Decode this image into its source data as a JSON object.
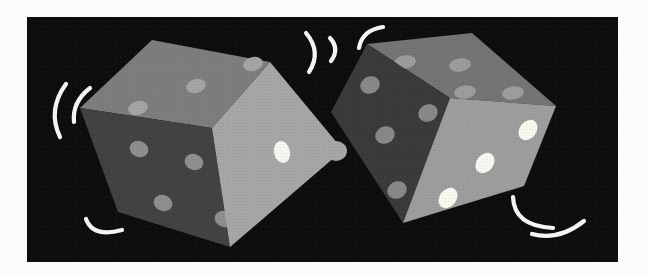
{
  "illustration": {
    "title": "Clip art of two rolling dice on a black panel with white motion lines",
    "background_color": "#fbfbf9",
    "panel_color": "#0d0d0d",
    "motion_line_color": "#f6f6f3",
    "motion_line_width": 4.2,
    "dice": [
      {
        "id": "left-die",
        "knob": {
          "cx": 336,
          "cy": 151,
          "rx": 11,
          "ry": 10
        },
        "faces": [
          {
            "id": "left-die-top-face",
            "value": 3,
            "color": "#7d7d7d",
            "pip_color": "#a4a4a4",
            "points": "152,40 270,62 212,128 80,108",
            "pip_rx": 10,
            "pip_ry": 7,
            "pip_rot": -14,
            "pips": [
              [
                138,
                108
              ],
              [
                196,
                86
              ],
              [
                253,
                64
              ]
            ]
          },
          {
            "id": "left-die-front-face",
            "value": 4,
            "color": "#424242",
            "pip_color": "#8e8e8e",
            "points": "80,108 212,128 230,247 118,212",
            "pip_rx": 9.5,
            "pip_ry": 8,
            "pip_rot": 18,
            "pips": [
              [
                139,
                149
              ],
              [
                194,
                162
              ],
              [
                163,
                203
              ],
              [
                224,
                219
              ]
            ]
          },
          {
            "id": "left-die-right-face",
            "value": 1,
            "color": "#a6a6a6",
            "pip_color": "#f6f6ee",
            "points": "212,128 270,62 343,150 230,247",
            "pip_rx": 8,
            "pip_ry": 11,
            "pip_rot": -12,
            "pips": [
              [
                282,
                152
              ]
            ]
          }
        ]
      },
      {
        "id": "right-die",
        "faces": [
          {
            "id": "right-die-top-face",
            "value": 4,
            "color": "#747474",
            "pip_color": "#9c9c9c",
            "points": "367,44 472,33 556,106 450,98",
            "pip_rx": 11,
            "pip_ry": 6.5,
            "pip_rot": -8,
            "pips": [
              [
                405,
                62
              ],
              [
                460,
                65
              ],
              [
                465,
                92
              ],
              [
                513,
                93
              ]
            ]
          },
          {
            "id": "right-die-left-face",
            "value": 4,
            "color": "#3a3a3a",
            "pip_color": "#888888",
            "points": "331,112 367,44 450,98 403,223",
            "pip_rx": 10,
            "pip_ry": 8.5,
            "pip_rot": -25,
            "pips": [
              [
                370,
                85
              ],
              [
                428,
                113
              ],
              [
                385,
                135
              ],
              [
                397,
                190
              ]
            ]
          },
          {
            "id": "right-die-right-face",
            "value": 3,
            "color": "#9d9d9d",
            "pip_color": "#f8f8f1",
            "points": "450,98 556,106 524,186 403,223",
            "pip_rx": 8.5,
            "pip_ry": 11,
            "pip_rot": 38,
            "pips": [
              [
                528,
                130
              ],
              [
                485,
                163
              ],
              [
                448,
                198
              ]
            ]
          }
        ]
      }
    ],
    "motion_lines": [
      {
        "id": "left-outer-arc",
        "d": "M 66,84 Q 47,110 60,137"
      },
      {
        "id": "left-inner-arc",
        "d": "M 90,88 Q 72,102 74,122"
      },
      {
        "id": "top-left-arc",
        "d": "M 306,33 Q 322,52 309,72"
      },
      {
        "id": "top-middle-arc",
        "d": "M 330,38 Q 340,49 331,61"
      },
      {
        "id": "top-right-arc",
        "d": "M 383,27 Q 362,30 359,48"
      },
      {
        "id": "bottom-left-arc",
        "d": "M 86,219 Q 93,238 122,230"
      },
      {
        "id": "bottom-right-upper-arc",
        "d": "M 513,197 Q 514,226 553,228"
      },
      {
        "id": "bottom-right-lower-arc",
        "d": "M 532,234 Q 559,241 584,221"
      }
    ]
  }
}
